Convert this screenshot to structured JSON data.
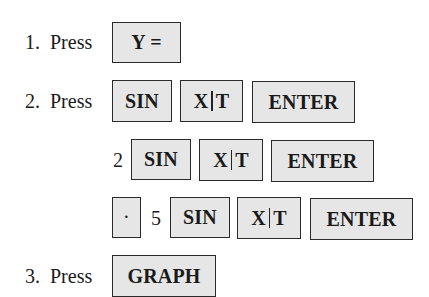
{
  "steps": [
    {
      "number": "1.",
      "verb": "Press",
      "keys": [
        {
          "label": "Y ="
        }
      ]
    },
    {
      "number": "2.",
      "verb": "Press",
      "keys": [
        {
          "label": "SIN"
        },
        {
          "label_left": "X",
          "label_right": "T"
        },
        {
          "label": "ENTER"
        }
      ]
    },
    {
      "prefix": "2",
      "keys": [
        {
          "label": "SIN"
        },
        {
          "label_left": "X",
          "label_right": "T"
        },
        {
          "label": "ENTER"
        }
      ]
    },
    {
      "prefix_key": "·",
      "prefix": "5",
      "keys": [
        {
          "label": "SIN"
        },
        {
          "label_left": "X",
          "label_right": "T"
        },
        {
          "label": "ENTER"
        }
      ]
    },
    {
      "number": "3.",
      "verb": "Press",
      "keys": [
        {
          "label": "GRAPH"
        }
      ]
    }
  ]
}
